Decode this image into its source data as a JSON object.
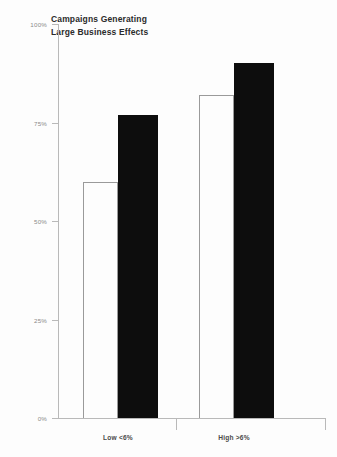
{
  "chart_data": {
    "type": "bar",
    "title": "Campaigns Generating\nLarge Business Effects",
    "xlabel": "",
    "ylabel": "",
    "categories": [
      "Low <6%",
      "High >6%"
    ],
    "series": [
      {
        "name": "open",
        "values": [
          60,
          82
        ]
      },
      {
        "name": "filled",
        "values": [
          77,
          90
        ]
      }
    ],
    "ylim": [
      0,
      100
    ],
    "ytick_labels": [
      "0%",
      "25%",
      "50%",
      "75%",
      "100%"
    ],
    "ytick_values": [
      0,
      25,
      50,
      75,
      100
    ],
    "grid": false,
    "legend": "none"
  },
  "colors": {
    "bar_filled": "#0d0d0d",
    "bar_open_fill": "#fdfdfd",
    "bar_open_stroke": "#9a9a9a",
    "axis": "#b9b9b9",
    "title_text": "#2b2b2b",
    "tick_text": "#8a8a8a",
    "category_text": "#4a4a4a",
    "background": "#fdfdfd"
  }
}
